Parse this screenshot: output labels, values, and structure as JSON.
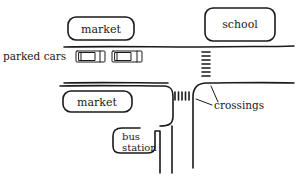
{
  "diagram": {
    "type": "street-map-sketch",
    "colors": {
      "ink": "#1a1a1a",
      "background": "#ffffff"
    },
    "buildings": [
      {
        "id": "market-top",
        "label": "market"
      },
      {
        "id": "school",
        "label": "school"
      },
      {
        "id": "market-bottom",
        "label": "market"
      },
      {
        "id": "bus-station",
        "label_line1": "bus",
        "label_line2": "station"
      }
    ],
    "labels": {
      "parked_cars": "parked cars",
      "crossings": "crossings"
    },
    "parked_cars_count": 2,
    "crossings_count": 2
  }
}
